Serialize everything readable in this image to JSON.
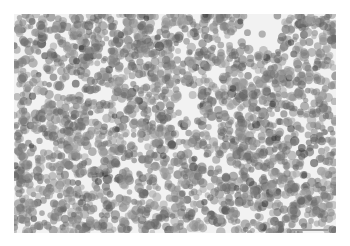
{
  "image": {
    "type": "grayscale micrograph",
    "description": "Dense field of round cells with dark gray stained nuclei on a light background",
    "frame": {
      "x": 14,
      "y": 14,
      "width": 322,
      "height": 219
    },
    "background_color": "#f2f2f2",
    "cell_color_range": [
      "#5a5a5a",
      "#a8a8a8"
    ],
    "dark_cell_color": "#3a3a3a",
    "cell_radius_px": [
      3,
      5
    ]
  },
  "scale_bar": {
    "color": "#9a9a9a",
    "width_px": 36
  }
}
